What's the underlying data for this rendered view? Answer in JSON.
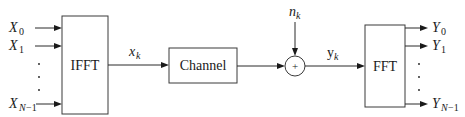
{
  "diagram": {
    "blocks": {
      "ifft": {
        "label": "IFFT"
      },
      "channel": {
        "label": "Channel"
      },
      "adder": {
        "label": "+"
      },
      "fft": {
        "label": "FFT"
      }
    },
    "inputs": [
      {
        "symbol": "X",
        "subscript": "0"
      },
      {
        "symbol": "X",
        "subscript": "1"
      },
      {
        "symbol": "X",
        "subscript": "N",
        "subscript_suffix": "−1"
      }
    ],
    "outputs": [
      {
        "symbol": "Y",
        "subscript": "0"
      },
      {
        "symbol": "Y",
        "subscript": "1"
      },
      {
        "symbol": "Y",
        "subscript": "N",
        "subscript_suffix": "−1"
      }
    ],
    "signals": {
      "ifft_out": {
        "symbol": "x",
        "subscript": "k"
      },
      "noise": {
        "symbol": "n",
        "subscript": "k"
      },
      "channel_out": {
        "symbol": "y",
        "subscript": "k"
      }
    },
    "ellipsis": "⋮"
  }
}
